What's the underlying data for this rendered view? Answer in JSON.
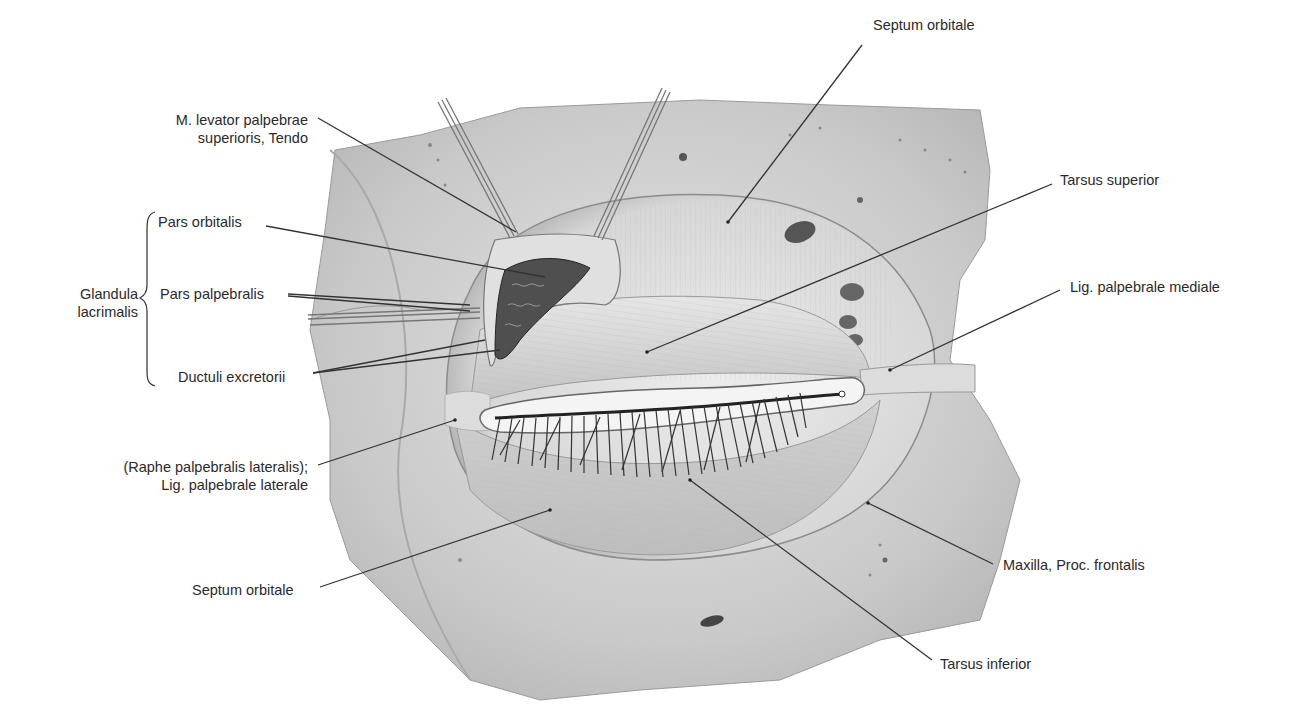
{
  "figure": {
    "colors": {
      "background": "#ffffff",
      "text": "#2a2a2a",
      "leader_line": "#333333",
      "bone": "#cfcfcf",
      "septum": "#e2e2e2",
      "tarsus": "#d4d4d4",
      "gland": "#555555"
    }
  },
  "labels": {
    "septum_orbitale_top": "Septum orbitale",
    "levator_line1": "M. levator palpebrae",
    "levator_line2": "superioris, Tendo",
    "tarsus_superior": "Tarsus superior",
    "pars_orbitalis": "Pars orbitalis",
    "glandula_line1": "Glandula",
    "glandula_line2": "lacrimalis",
    "pars_palpebralis": "Pars palpebralis",
    "lig_palpebrale_mediale": "Lig. palpebrale mediale",
    "ductuli_excretorii": "Ductuli excretorii",
    "raphe_line1": "(Raphe palpebralis lateralis);",
    "raphe_line2": "Lig. palpebrale laterale",
    "maxilla": "Maxilla, Proc. frontalis",
    "septum_orbitale_bottom": "Septum orbitale",
    "tarsus_inferior": "Tarsus inferior"
  }
}
